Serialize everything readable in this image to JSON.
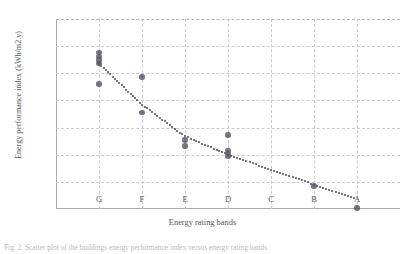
{
  "figure": {
    "caption": "Fig. 2. Scatter plot of the buildings energy performance index versus energy rating bands."
  },
  "chart_data": {
    "type": "scatter",
    "title": "",
    "xlabel": "Energy rating bands",
    "ylabel": "Energy performance index (kWh/m2.y)",
    "xlim": [
      "G",
      "A"
    ],
    "ylim": [
      0,
      350
    ],
    "grid": true,
    "legend": "none",
    "categories": [
      "G",
      "F",
      "E",
      "D",
      "C",
      "B",
      "A"
    ],
    "ytick_labels": [
      "0.00",
      "50.00",
      "100.00",
      "150.00",
      "200.00",
      "250.00",
      "300.00",
      "350.00"
    ],
    "ytick_values": [
      0,
      50,
      100,
      150,
      200,
      250,
      300,
      350
    ],
    "ytick_step": 50,
    "points": [
      {
        "x": "G",
        "y": 288
      },
      {
        "x": "G",
        "y": 281
      },
      {
        "x": "G",
        "y": 274
      },
      {
        "x": "G",
        "y": 268
      },
      {
        "x": "G",
        "y": 230
      },
      {
        "x": "F",
        "y": 243
      },
      {
        "x": "F",
        "y": 178
      },
      {
        "x": "E",
        "y": 127
      },
      {
        "x": "E",
        "y": 116
      },
      {
        "x": "D",
        "y": 136
      },
      {
        "x": "D",
        "y": 108
      },
      {
        "x": "D",
        "y": 102
      },
      {
        "x": "D",
        "y": 97
      },
      {
        "x": "B",
        "y": 42
      },
      {
        "x": "A",
        "y": 2
      }
    ],
    "trendline": {
      "style": "dotted",
      "points": [
        {
          "x": "G",
          "y": 268
        },
        {
          "x": "F",
          "y": 192
        },
        {
          "x": "E",
          "y": 134
        },
        {
          "x": "D",
          "y": 100
        },
        {
          "x": "C",
          "y": 72
        },
        {
          "x": "B",
          "y": 45
        },
        {
          "x": "A",
          "y": 18
        }
      ]
    },
    "colors": {
      "marker": "#555566",
      "grid": "#c9c9d6",
      "axis": "#a9a9b4",
      "text": "#575757"
    }
  }
}
